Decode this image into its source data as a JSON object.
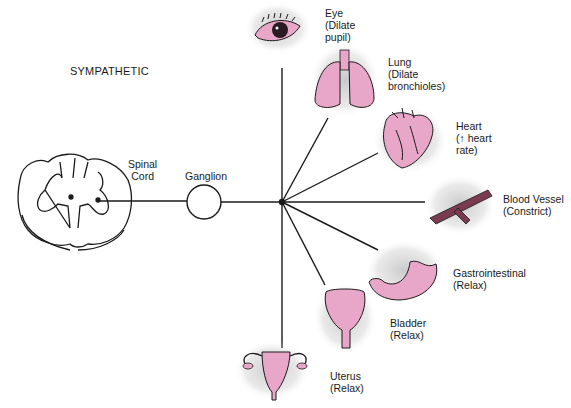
{
  "title": "SYMPATHETIC",
  "origin": {
    "spinal_cord": "Spinal\nCord",
    "ganglion": "Ganglion"
  },
  "organs": [
    {
      "id": "eye",
      "name": "Eye",
      "effect": "(Dilate\npupil)"
    },
    {
      "id": "lung",
      "name": "Lung",
      "effect": "(Dilate\nbronchioles)"
    },
    {
      "id": "heart",
      "name": "Heart",
      "effect": "(↑ heart\nrate)"
    },
    {
      "id": "blood-vessel",
      "name": "Blood Vessel",
      "effect": "(Constrict)"
    },
    {
      "id": "gastrointestinal",
      "name": "Gastrointestinal",
      "effect": "(Relax)"
    },
    {
      "id": "bladder",
      "name": "Bladder",
      "effect": "(Relax)"
    },
    {
      "id": "uterus",
      "name": "Uterus",
      "effect": "(Relax)"
    }
  ],
  "colors": {
    "organ_fill": "#e8a6c8",
    "line": "#1a1a1a",
    "stipple": "#9a9a9a"
  }
}
